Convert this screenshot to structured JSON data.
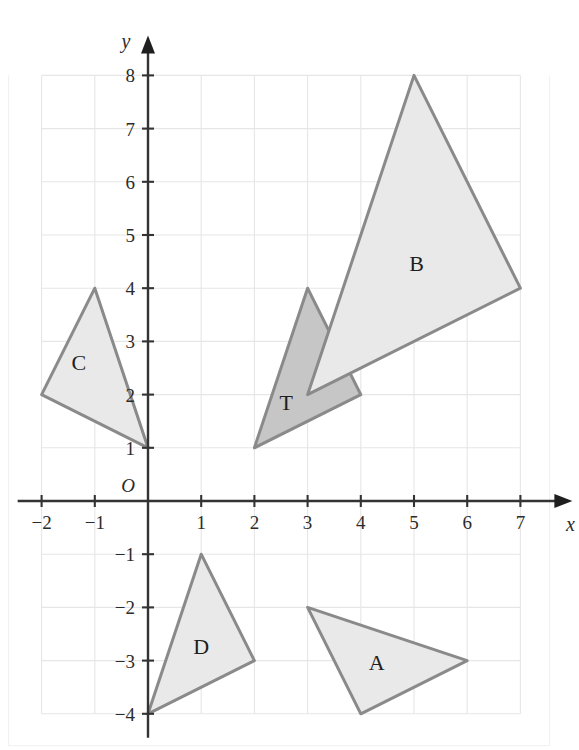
{
  "figure": {
    "background_color": "#ffffff",
    "grid_color": "#e6e6e6",
    "axis_color": "#333333"
  },
  "axes": {
    "x_name": "x",
    "y_name": "y",
    "origin_label": "O",
    "x_ticks": [
      "−2",
      "−1",
      "1",
      "2",
      "3",
      "4",
      "5",
      "6",
      "7"
    ],
    "y_ticks": [
      "8",
      "7",
      "6",
      "5",
      "4",
      "3",
      "2",
      "1",
      "−1",
      "−2",
      "−3",
      "−4"
    ]
  },
  "chart_data": {
    "type": "scatter",
    "xlabel": "x",
    "ylabel": "y",
    "xlim": [
      -2,
      7
    ],
    "ylim": [
      -4,
      8
    ],
    "grid": true,
    "legend": "none",
    "x_tick_values": [
      -2,
      -1,
      0,
      1,
      2,
      3,
      4,
      5,
      6,
      7
    ],
    "y_tick_values": [
      -4,
      -3,
      -2,
      -1,
      0,
      1,
      2,
      3,
      4,
      5,
      6,
      7,
      8
    ],
    "shapes": [
      {
        "label": "T",
        "kind": "triangle",
        "points": [
          [
            2,
            1
          ],
          [
            3,
            4
          ],
          [
            4,
            2
          ]
        ],
        "fill": "#c6c6c6",
        "stroke": "#8a8a8a",
        "label_at": [
          2.6,
          1.85
        ]
      },
      {
        "label": "B",
        "kind": "triangle",
        "points": [
          [
            3,
            2
          ],
          [
            5,
            8
          ],
          [
            7,
            4
          ]
        ],
        "fill": "#e9e9e9",
        "stroke": "#8a8a8a",
        "label_at": [
          5.05,
          4.45
        ]
      },
      {
        "label": "C",
        "kind": "triangle",
        "points": [
          [
            -2,
            2
          ],
          [
            -1,
            4
          ],
          [
            0,
            1
          ]
        ],
        "fill": "#e9e9e9",
        "stroke": "#8a8a8a",
        "label_at": [
          -1.3,
          2.6
        ]
      },
      {
        "label": "D",
        "kind": "triangle",
        "points": [
          [
            0,
            -4
          ],
          [
            1,
            -1
          ],
          [
            2,
            -3
          ]
        ],
        "fill": "#e9e9e9",
        "stroke": "#8a8a8a",
        "label_at": [
          1.0,
          -2.75
        ]
      },
      {
        "label": "A",
        "kind": "triangle",
        "points": [
          [
            3,
            -2
          ],
          [
            4,
            -4
          ],
          [
            6,
            -3
          ]
        ],
        "fill": "#e9e9e9",
        "stroke": "#8a8a8a",
        "label_at": [
          4.3,
          -3.05
        ]
      }
    ]
  }
}
